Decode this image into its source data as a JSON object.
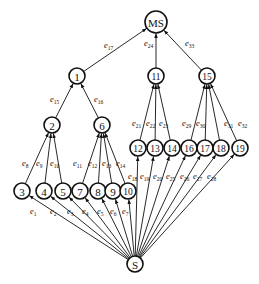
{
  "diagram": {
    "type": "directed-tree",
    "nodes": [
      {
        "id": "MS",
        "label": "MS",
        "x": 156,
        "y": 22,
        "r": 11
      },
      {
        "id": "1",
        "label": "1",
        "x": 77,
        "y": 76,
        "r": 8
      },
      {
        "id": "11",
        "label": "11",
        "x": 156,
        "y": 76,
        "r": 8
      },
      {
        "id": "15",
        "label": "15",
        "x": 207,
        "y": 76,
        "r": 8
      },
      {
        "id": "2",
        "label": "2",
        "x": 52,
        "y": 125,
        "r": 8
      },
      {
        "id": "6",
        "label": "6",
        "x": 102,
        "y": 125,
        "r": 8
      },
      {
        "id": "12",
        "label": "12",
        "x": 138,
        "y": 148,
        "r": 8
      },
      {
        "id": "13",
        "label": "13",
        "x": 155,
        "y": 148,
        "r": 8
      },
      {
        "id": "14",
        "label": "14",
        "x": 172,
        "y": 148,
        "r": 8
      },
      {
        "id": "16",
        "label": "16",
        "x": 189,
        "y": 148,
        "r": 8
      },
      {
        "id": "17",
        "label": "17",
        "x": 205,
        "y": 148,
        "r": 8
      },
      {
        "id": "18",
        "label": "18",
        "x": 221,
        "y": 148,
        "r": 8
      },
      {
        "id": "19",
        "label": "19",
        "x": 240,
        "y": 148,
        "r": 8
      },
      {
        "id": "3",
        "label": "3",
        "x": 22,
        "y": 191,
        "r": 8
      },
      {
        "id": "4",
        "label": "4",
        "x": 44,
        "y": 191,
        "r": 8
      },
      {
        "id": "5",
        "label": "5",
        "x": 63,
        "y": 191,
        "r": 8
      },
      {
        "id": "7",
        "label": "7",
        "x": 80,
        "y": 191,
        "r": 8
      },
      {
        "id": "8",
        "label": "8",
        "x": 98,
        "y": 191,
        "r": 8
      },
      {
        "id": "9",
        "label": "9",
        "x": 113,
        "y": 191,
        "r": 8
      },
      {
        "id": "10",
        "label": "10",
        "x": 128,
        "y": 191,
        "r": 8
      },
      {
        "id": "S",
        "label": "S",
        "x": 135,
        "y": 264,
        "r": 8
      }
    ],
    "edges": [
      {
        "from": "S",
        "to": "3",
        "label": "e",
        "sub": "1",
        "lx": 30,
        "ly": 214
      },
      {
        "from": "S",
        "to": "4",
        "label": "e",
        "sub": "2",
        "lx": 50,
        "ly": 214
      },
      {
        "from": "S",
        "to": "5",
        "label": "e",
        "sub": "3",
        "lx": 67,
        "ly": 214
      },
      {
        "from": "S",
        "to": "7",
        "label": "e",
        "sub": "4",
        "lx": 82,
        "ly": 214
      },
      {
        "from": "S",
        "to": "8",
        "label": "e",
        "sub": "5",
        "lx": 97,
        "ly": 214
      },
      {
        "from": "S",
        "to": "9",
        "label": "e",
        "sub": "6",
        "lx": 110,
        "ly": 214
      },
      {
        "from": "S",
        "to": "10",
        "label": "e",
        "sub": "7",
        "lx": 122,
        "ly": 214
      },
      {
        "from": "3",
        "to": "2",
        "label": "e",
        "sub": "8",
        "lx": 22,
        "ly": 166
      },
      {
        "from": "4",
        "to": "2",
        "label": "e",
        "sub": "9",
        "lx": 36,
        "ly": 166
      },
      {
        "from": "5",
        "to": "2",
        "label": "e",
        "sub": "10",
        "lx": 50,
        "ly": 166
      },
      {
        "from": "7",
        "to": "6",
        "label": "e",
        "sub": "11",
        "lx": 73,
        "ly": 166
      },
      {
        "from": "8",
        "to": "6",
        "label": "e",
        "sub": "12",
        "lx": 88,
        "ly": 166
      },
      {
        "from": "9",
        "to": "6",
        "label": "e",
        "sub": "13",
        "lx": 102,
        "ly": 166
      },
      {
        "from": "10",
        "to": "6",
        "label": "e",
        "sub": "14",
        "lx": 116,
        "ly": 166
      },
      {
        "from": "2",
        "to": "1",
        "label": "e",
        "sub": "15",
        "lx": 50,
        "ly": 102
      },
      {
        "from": "6",
        "to": "1",
        "label": "e",
        "sub": "16",
        "lx": 94,
        "ly": 102
      },
      {
        "from": "1",
        "to": "MS",
        "label": "e",
        "sub": "17",
        "lx": 104,
        "ly": 48
      },
      {
        "from": "S",
        "to": "12",
        "label": "e",
        "sub": "18",
        "lx": 128,
        "ly": 179
      },
      {
        "from": "S",
        "to": "13",
        "label": "e",
        "sub": "19",
        "lx": 140,
        "ly": 179
      },
      {
        "from": "S",
        "to": "14",
        "label": "e",
        "sub": "20",
        "lx": 153,
        "ly": 179
      },
      {
        "from": "12",
        "to": "11",
        "label": "e",
        "sub": "21",
        "lx": 132,
        "ly": 126
      },
      {
        "from": "13",
        "to": "11",
        "label": "e",
        "sub": "22",
        "lx": 146,
        "ly": 126
      },
      {
        "from": "14",
        "to": "11",
        "label": "e",
        "sub": "23",
        "lx": 159,
        "ly": 126
      },
      {
        "from": "11",
        "to": "MS",
        "label": "e",
        "sub": "24",
        "lx": 144,
        "ly": 46
      },
      {
        "from": "S",
        "to": "16",
        "label": "e",
        "sub": "25",
        "lx": 166,
        "ly": 179
      },
      {
        "from": "S",
        "to": "17",
        "label": "e",
        "sub": "26",
        "lx": 180,
        "ly": 179
      },
      {
        "from": "S",
        "to": "18",
        "label": "e",
        "sub": "27",
        "lx": 193,
        "ly": 179
      },
      {
        "from": "S",
        "to": "19",
        "label": "e",
        "sub": "28",
        "lx": 207,
        "ly": 179
      },
      {
        "from": "16",
        "to": "15",
        "label": "e",
        "sub": "29",
        "lx": 182,
        "ly": 126
      },
      {
        "from": "17",
        "to": "15",
        "label": "e",
        "sub": "30",
        "lx": 196,
        "ly": 126
      },
      {
        "from": "18",
        "to": "15",
        "label": "e",
        "sub": "31",
        "lx": 224,
        "ly": 126
      },
      {
        "from": "19",
        "to": "15",
        "label": "e",
        "sub": "32",
        "lx": 238,
        "ly": 126
      },
      {
        "from": "15",
        "to": "MS",
        "label": "e",
        "sub": "33",
        "lx": 185,
        "ly": 46
      }
    ]
  }
}
